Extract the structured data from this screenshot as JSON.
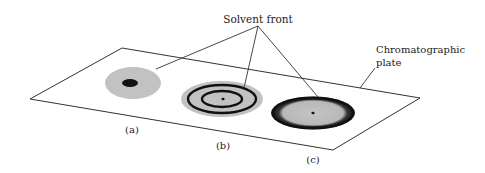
{
  "diagram": {
    "type": "chromatography-plate-illustration",
    "callouts": {
      "solvent_front": "Solvent front",
      "plate_line1": "Chromatographic",
      "plate_line2": "plate"
    },
    "spots": [
      {
        "id": "a",
        "label": "(a)",
        "description": "gray solvent area with single dark spot"
      },
      {
        "id": "b",
        "label": "(b)",
        "description": "gray solvent area with two concentric dark rings and central dot"
      },
      {
        "id": "c",
        "label": "(c)",
        "description": "gray solvent area with dark outer ring and central dot"
      }
    ],
    "colors": {
      "line": "#333333",
      "solvent_gray": "#bdbdbd",
      "ring_dark": "#111111",
      "background": "#ffffff"
    }
  }
}
